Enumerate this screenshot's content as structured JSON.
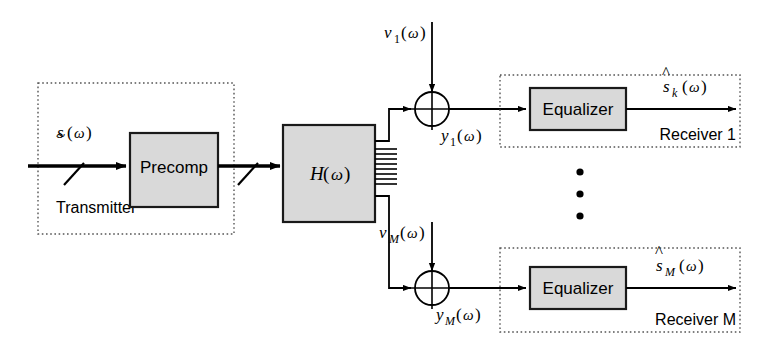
{
  "diagram": {
    "colors": {
      "block_fill": "#d9d9d9",
      "block_stroke": "#1a1a1a",
      "line": "#000000",
      "group_border": "#4d4d4d",
      "background": "#ffffff"
    },
    "transmitter": {
      "group_label": "Transmitter",
      "block_label": "Precomp",
      "input_signal": {
        "base": "s",
        "accent": "~",
        "arg": "(ω)",
        "full": "s̃(ω)"
      },
      "bus_slash_count": 2
    },
    "channel": {
      "block_label": {
        "base": "H",
        "arg": "(ω)",
        "full": "H(ω)"
      },
      "bus_stub_count": 8
    },
    "branches": [
      {
        "id": "top",
        "noise": {
          "base": "ν",
          "sub": "1",
          "arg": "(ω)",
          "full": "ν₁(ω)"
        },
        "summer_symbol": "⊕",
        "received": {
          "base": "y",
          "sub": "1",
          "arg": "(ω)",
          "full": "y₁(ω)"
        },
        "block_label": "Equalizer",
        "output": {
          "base": "s",
          "accent": "^",
          "sub": "k",
          "arg": "(ω)",
          "full": "ŝₖ(ω)"
        },
        "group_label": "Receiver 1"
      },
      {
        "id": "bottom",
        "noise": {
          "base": "ν",
          "sub": "M",
          "arg": "(ω)",
          "full": "ν_M(ω)"
        },
        "summer_symbol": "⊕",
        "received": {
          "base": "y",
          "sub": "M",
          "arg": "(ω)",
          "full": "y_M(ω)"
        },
        "block_label": "Equalizer",
        "output": {
          "base": "s",
          "accent": "^",
          "sub": "M",
          "arg": "(ω)",
          "full": "ŝ_M(ω)"
        },
        "group_label": "Receiver M"
      }
    ],
    "ellipsis": {
      "dot_count": 3,
      "orientation": "vertical"
    }
  }
}
